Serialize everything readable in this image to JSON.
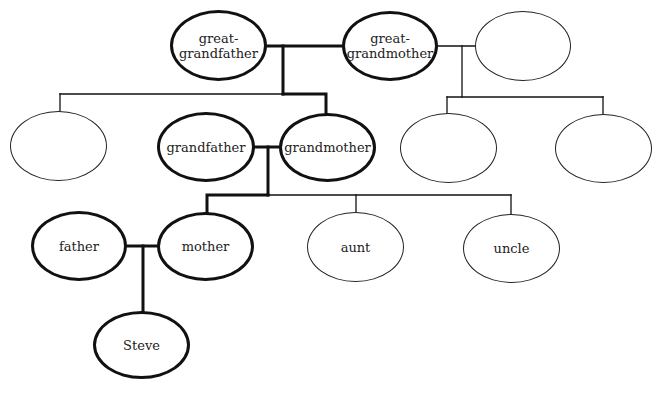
{
  "diagram": {
    "type": "family-tree",
    "colors": {
      "line": "#111111",
      "text": "#222222",
      "background": "#ffffff"
    },
    "nodes": {
      "great_grandfather": {
        "line1": "great-",
        "line2": "grandfather"
      },
      "great_grandmother": {
        "line1": "great-",
        "line2": "grandmother"
      },
      "blank_top_right": {
        "label": ""
      },
      "blank_left": {
        "label": ""
      },
      "grandfather": {
        "label": "grandfather"
      },
      "grandmother": {
        "label": "grandmother"
      },
      "blank_right_1": {
        "label": ""
      },
      "blank_right_2": {
        "label": ""
      },
      "father": {
        "label": "father"
      },
      "mother": {
        "label": "mother"
      },
      "aunt": {
        "label": "aunt"
      },
      "uncle": {
        "label": "uncle"
      },
      "steve": {
        "label": "Steve"
      }
    },
    "relationships": [
      {
        "type": "marriage",
        "between": [
          "great_grandfather",
          "great_grandmother"
        ],
        "children": [
          "blank_left",
          "grandmother"
        ]
      },
      {
        "type": "marriage",
        "between": [
          "great_grandmother",
          "blank_top_right"
        ],
        "children": [
          "blank_right_1",
          "blank_right_2"
        ]
      },
      {
        "type": "marriage",
        "between": [
          "grandfather",
          "grandmother"
        ],
        "children": [
          "mother",
          "aunt",
          "uncle"
        ]
      },
      {
        "type": "marriage",
        "between": [
          "father",
          "mother"
        ],
        "children": [
          "steve"
        ]
      }
    ]
  }
}
